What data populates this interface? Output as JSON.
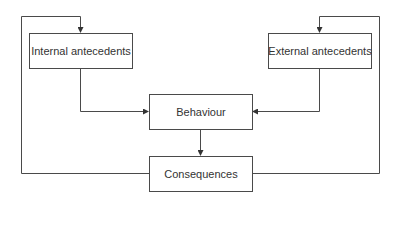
{
  "diagram": {
    "nodes": {
      "internal": {
        "label": "Internal antecedents"
      },
      "external": {
        "label": "External antecedents"
      },
      "behaviour": {
        "label": "Behaviour"
      },
      "consequences": {
        "label": "Consequences"
      }
    },
    "edges": [
      {
        "from": "internal",
        "to": "behaviour"
      },
      {
        "from": "external",
        "to": "behaviour"
      },
      {
        "from": "behaviour",
        "to": "consequences"
      },
      {
        "from": "consequences",
        "to": "internal"
      },
      {
        "from": "consequences",
        "to": "external"
      }
    ],
    "colors": {
      "line": "#4a4a4a",
      "text": "#333333",
      "background": "#ffffff"
    }
  }
}
